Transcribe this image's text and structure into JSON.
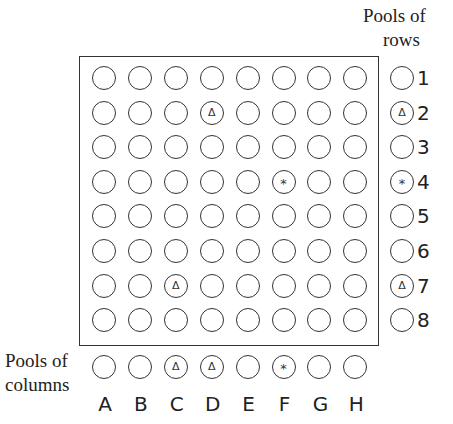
{
  "labels": {
    "pools_rows_line1": "Pools of",
    "pools_rows_line2": "rows",
    "pools_cols_line1": "Pools of",
    "pools_cols_line2": "columns"
  },
  "columns": [
    "A",
    "B",
    "C",
    "D",
    "E",
    "F",
    "G",
    "H"
  ],
  "rows": [
    "1",
    "2",
    "3",
    "4",
    "5",
    "6",
    "7",
    "8"
  ],
  "symbols": {
    "triangle": "Δ",
    "asterisk": "*"
  },
  "grid_marks": [
    {
      "row": 2,
      "col": "D",
      "mark": "triangle"
    },
    {
      "row": 4,
      "col": "F",
      "mark": "asterisk"
    },
    {
      "row": 7,
      "col": "C",
      "mark": "triangle"
    }
  ],
  "row_pools": [
    {
      "label": "1",
      "mark": ""
    },
    {
      "label": "2",
      "mark": "triangle"
    },
    {
      "label": "3",
      "mark": ""
    },
    {
      "label": "4",
      "mark": "asterisk"
    },
    {
      "label": "5",
      "mark": ""
    },
    {
      "label": "6",
      "mark": ""
    },
    {
      "label": "7",
      "mark": "triangle"
    },
    {
      "label": "8",
      "mark": ""
    }
  ],
  "column_pools": [
    {
      "label": "A",
      "mark": ""
    },
    {
      "label": "B",
      "mark": ""
    },
    {
      "label": "C",
      "mark": "triangle"
    },
    {
      "label": "D",
      "mark": "triangle"
    },
    {
      "label": "E",
      "mark": ""
    },
    {
      "label": "F",
      "mark": "asterisk"
    },
    {
      "label": "G",
      "mark": ""
    },
    {
      "label": "H",
      "mark": ""
    }
  ]
}
